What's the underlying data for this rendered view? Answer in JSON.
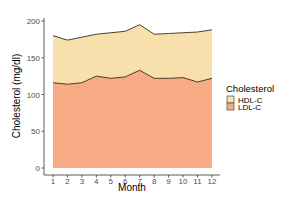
{
  "chart_data": {
    "type": "area",
    "stacked": true,
    "title": "",
    "xlabel": "Month",
    "ylabel": "Cholesterol (mg/dl)",
    "x": [
      1,
      2,
      3,
      4,
      5,
      6,
      7,
      8,
      9,
      10,
      11,
      12
    ],
    "x_ticks": [
      "1",
      "2",
      "3",
      "4",
      "5",
      "6",
      "7",
      "8",
      "9",
      "10",
      "11",
      "12"
    ],
    "y_ticks": [
      "0",
      "50",
      "100",
      "150",
      "200"
    ],
    "ylim": [
      0,
      200
    ],
    "grid": false,
    "legend": {
      "title": "Cholesterol",
      "position": "right",
      "entries": [
        "HDL-C",
        "LDL-C"
      ]
    },
    "series": [
      {
        "name": "LDL-C",
        "color": "#f7ab84",
        "values": [
          116,
          114,
          116,
          125,
          122,
          124,
          133,
          122,
          122,
          123,
          117,
          122
        ]
      },
      {
        "name": "HDL-C",
        "color": "#f8e0ac",
        "values": [
          64,
          60,
          62,
          57,
          62,
          62,
          62,
          60,
          61,
          61,
          68,
          66
        ]
      }
    ]
  }
}
